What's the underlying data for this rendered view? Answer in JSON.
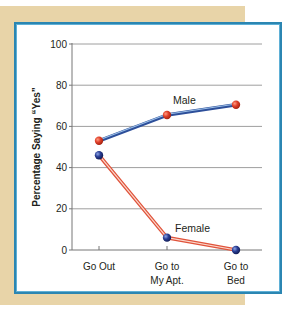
{
  "chart_data": {
    "type": "line",
    "title": "",
    "xlabel": "",
    "ylabel": "Percentage Saying “Yes”",
    "categories": [
      "Go Out",
      "Go to My Apt.",
      "Go to Bed"
    ],
    "category_lines": [
      [
        "Go Out"
      ],
      [
        "Go to",
        "My Apt."
      ],
      [
        "Go to",
        "Bed"
      ]
    ],
    "series": [
      {
        "name": "Male",
        "values": [
          53,
          65.5,
          70.5
        ],
        "line_color": "#2d4f9a",
        "highlight_color": "#9cc0e8",
        "marker_color": "#e0402a"
      },
      {
        "name": "Female",
        "values": [
          46,
          6,
          0
        ],
        "line_color": "#e0533b",
        "highlight_color": "#fbd8cc",
        "marker_color": "#23398c"
      }
    ],
    "ylim": [
      0,
      100
    ],
    "yticks": [
      0,
      20,
      40,
      60,
      80,
      100
    ],
    "grid": true,
    "legend": "inline labels"
  },
  "colors": {
    "frame_border": "#2b86b2",
    "background_tan": "#e8d4a8",
    "gridline": "#9e9e9e"
  }
}
